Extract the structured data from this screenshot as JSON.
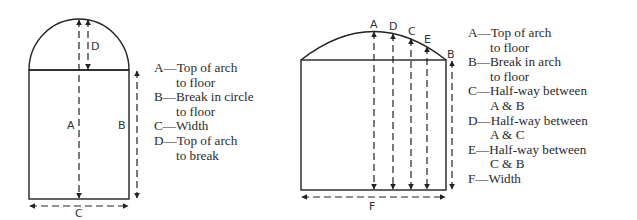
{
  "figures": [
    {
      "id": "semicircular-arch",
      "labels": {
        "A": "A",
        "B": "B",
        "C": "C",
        "D": "D"
      },
      "legend": [
        {
          "key": "A",
          "lines": [
            "—Top of arch",
            "to floor"
          ]
        },
        {
          "key": "B",
          "lines": [
            "—Break in circle",
            "to floor"
          ]
        },
        {
          "key": "C",
          "lines": [
            "—Width"
          ]
        },
        {
          "key": "D",
          "lines": [
            "—Top of arch",
            "to break"
          ]
        }
      ]
    },
    {
      "id": "segmental-arch",
      "labels": {
        "A": "A",
        "B": "B",
        "C": "C",
        "D": "D",
        "E": "E",
        "F": "F"
      },
      "legend": [
        {
          "key": "A",
          "lines": [
            "—Top of arch",
            "to floor"
          ]
        },
        {
          "key": "B",
          "lines": [
            "—Break in arch",
            "to floor"
          ]
        },
        {
          "key": "C",
          "lines": [
            "—Half-way between",
            "A & B"
          ]
        },
        {
          "key": "D",
          "lines": [
            "—Half-way between",
            "A & C"
          ]
        },
        {
          "key": "E",
          "lines": [
            "—Half-way between",
            "C & B"
          ]
        },
        {
          "key": "F",
          "lines": [
            "—Width"
          ]
        }
      ]
    }
  ],
  "colors": {
    "line": "#222222",
    "background": "#ffffff"
  }
}
